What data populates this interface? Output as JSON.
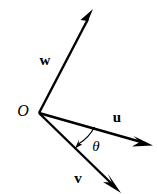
{
  "figure": {
    "background_color": "#ffffff",
    "stroke_color": "#000000",
    "width": 157,
    "height": 194
  },
  "origin": {
    "label": "O",
    "x": 39,
    "y": 113,
    "label_x": 23,
    "label_y": 112
  },
  "vectors": [
    {
      "id": "w",
      "label": "w",
      "start_x": 39,
      "start_y": 113,
      "end_x": 93,
      "end_y": 10,
      "label_x": 45,
      "label_y": 62,
      "color": "#000000"
    },
    {
      "id": "u",
      "label": "u",
      "start_x": 39,
      "start_y": 113,
      "end_x": 152,
      "end_y": 145,
      "label_x": 117,
      "label_y": 119,
      "color": "#000000"
    },
    {
      "id": "v",
      "label": "v",
      "start_x": 39,
      "start_y": 113,
      "end_x": 120,
      "end_y": 192,
      "label_x": 78,
      "label_y": 180,
      "color": "#000000"
    }
  ],
  "angle": {
    "label": "θ",
    "label_x": 96,
    "label_y": 148,
    "from_vector": "u",
    "to_vector": "v",
    "arc_start_x": 94,
    "arc_start_y": 128,
    "arc_end_x": 76,
    "arc_end_y": 147,
    "arc_radius": 42,
    "arrow_at": "v"
  }
}
